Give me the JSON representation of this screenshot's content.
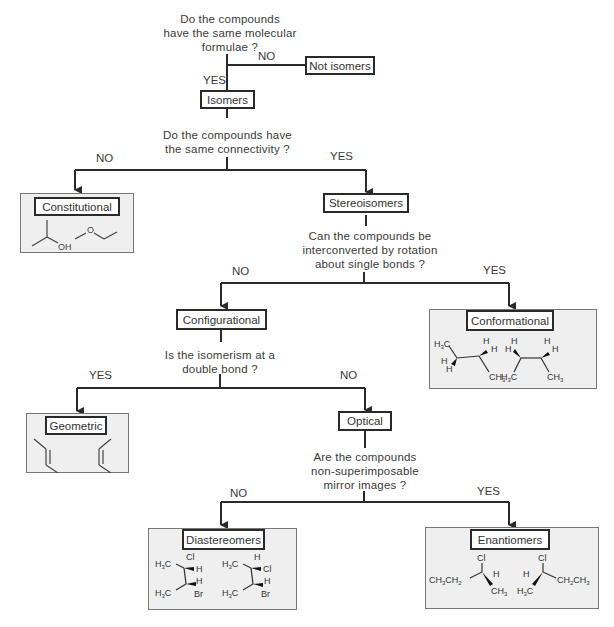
{
  "questions": {
    "q1": [
      "Do the compounds",
      "have the same molecular",
      "formulae ?"
    ],
    "q2": [
      "Do the compounds have",
      "the same connectivity ?"
    ],
    "q3": [
      "Can the compounds be",
      "interconverted by rotation",
      "about single bonds ?"
    ],
    "q4": [
      "Is the isomerism at a",
      "double bond ?"
    ],
    "q5": [
      "Are the compounds",
      "non-superimposable",
      "mirror images ?"
    ]
  },
  "branches": {
    "q1_no": "NO",
    "q1_yes": "YES",
    "q2_no": "NO",
    "q2_yes": "YES",
    "q3_no": "NO",
    "q3_yes": "YES",
    "q4_yes": "YES",
    "q4_no": "NO",
    "q5_no": "NO",
    "q5_yes": "YES"
  },
  "nodes": {
    "not_isomers": "Not isomers",
    "isomers": "Isomers",
    "constitutional": "Constitutional",
    "stereoisomers": "Stereoisomers",
    "configurational": "Configurational",
    "conformational": "Conformational",
    "geometric": "Geometric",
    "optical": "Optical",
    "diastereomers": "Diastereomers",
    "enantiomers": "Enantiomers"
  },
  "examples": {
    "constitutional": [
      "2-propanol (OH)",
      "methoxyethane (O)"
    ],
    "conformational": [
      "butane eclipsed/staggered (H3C, H, CH3)",
      "butane conformer (H3C, H, CH3)"
    ],
    "geometric": [
      "trans-2-butene",
      "cis-2-butene"
    ],
    "diastereomers": [
      "H3C, Cl, H / H3C, H, Br",
      "H3C, H, Cl / H3C, H, Br"
    ],
    "enantiomers": [
      "CH3CH2, Cl, H, CH3",
      "H, Cl, H3C, CH2CH3"
    ]
  },
  "atoms": {
    "OH": "OH",
    "O": "O",
    "Cl": "Cl",
    "H": "H",
    "Br": "Br",
    "H3C": "H₃C",
    "CH3": "CH₃",
    "CH3CH2": "CH₃CH₂",
    "CH2CH3": "CH₂CH₃"
  },
  "colors": {
    "line": "#2a2a2a",
    "panel_bg": "#efefef",
    "panel_border": "#777777",
    "text": "#3a3a3a"
  }
}
